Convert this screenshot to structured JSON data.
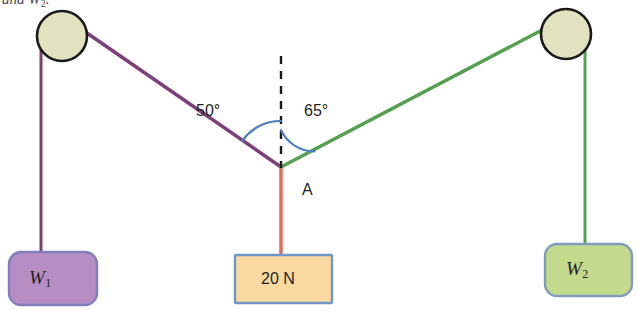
{
  "figure": {
    "caption_fragment": "and W",
    "caption_fragment_sub": "2",
    "caption_fragment_tail": ".",
    "background_color": "#ffffff"
  },
  "labels": {
    "angle_left": "50°",
    "angle_right": "65°",
    "junction_point": "A"
  },
  "blocks": [
    {
      "name": "weight-one",
      "symbol": "W",
      "subscript": "1",
      "fill_color": "#b68ec4",
      "border_color": "#7f7fc0"
    },
    {
      "name": "applied-force",
      "text": "20 N",
      "fill_color": "#fad9a0",
      "border_color": "#6f95c9"
    },
    {
      "name": "weight-two",
      "symbol": "W",
      "subscript": "2",
      "fill_color": "#c3d98c",
      "border_color": "#7f9bbd"
    }
  ],
  "ropes": [
    {
      "name": "rope-left",
      "color": "#7d3f78"
    },
    {
      "name": "rope-right",
      "color": "#55a050"
    },
    {
      "name": "rope-down",
      "color": "#de6f53"
    }
  ],
  "pulleys": [
    {
      "name": "pulley-left",
      "fill_color": "#e3e2c0",
      "border_color": "#1a1a1a"
    },
    {
      "name": "pulley-right",
      "fill_color": "#e3e2c0",
      "border_color": "#1a1a1a"
    }
  ],
  "guides": {
    "vertical_dashed_color": "#1a1a1a",
    "angle_arc_color": "#4f7fc0"
  }
}
